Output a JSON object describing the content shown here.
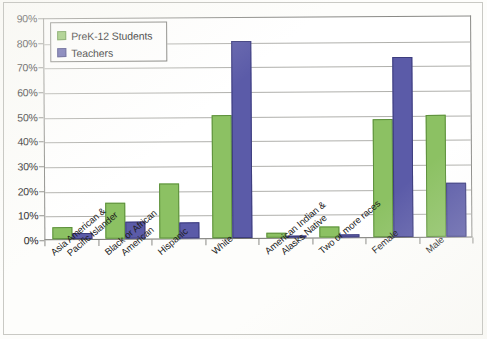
{
  "chart_data": {
    "type": "bar",
    "title": "",
    "xlabel": "",
    "ylabel": "",
    "ylim": [
      0,
      90
    ],
    "ytick_labels": [
      "0%",
      "10%",
      "20%",
      "30%",
      "40%",
      "50%",
      "60%",
      "70%",
      "80%",
      "90%"
    ],
    "ytick_values": [
      0,
      10,
      20,
      30,
      40,
      50,
      60,
      70,
      80,
      90
    ],
    "grid": true,
    "legend_position": "top-left",
    "categories": [
      "Asia American & Pacific Islander",
      "Black or African American",
      "Hispanic",
      "White",
      "American Indian & Alasks Native",
      "Two or more races",
      "Female",
      "Male"
    ],
    "category_lines": [
      [
        "Asia American &",
        "Pacific Islander"
      ],
      [
        "Black or African",
        "American"
      ],
      [
        "Hispanic"
      ],
      [
        "White"
      ],
      [
        "American Indian &",
        "Alasks Native"
      ],
      [
        "Two or more races"
      ],
      [
        "Female"
      ],
      [
        "Male"
      ]
    ],
    "series": [
      {
        "name": "PreK-12 Students",
        "color": "#8cc163",
        "values": [
          5,
          14.5,
          22.5,
          50,
          2,
          4.5,
          48,
          49.5
        ]
      },
      {
        "name": "Teachers",
        "color": "#5b5ba8",
        "values": [
          2.5,
          7,
          6.5,
          80,
          0.7,
          1.2,
          73,
          22
        ]
      }
    ]
  },
  "legend": {
    "items": [
      {
        "label": "PreK-12 Students",
        "swatch": "green-swatch"
      },
      {
        "label": "Teachers",
        "swatch": "blue-swatch"
      }
    ]
  },
  "colors": {
    "series_green": "#8cc163",
    "series_blue": "#5b5ba8",
    "gridline": "#b0b0ac",
    "axis": "#8a8a86",
    "page_background": "#fdfdfb"
  }
}
